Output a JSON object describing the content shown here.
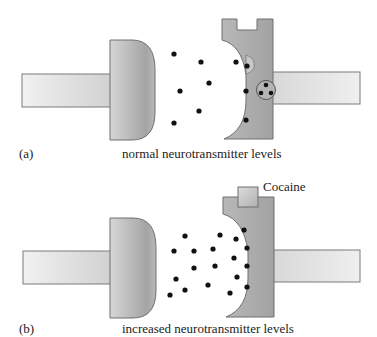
{
  "panels": [
    {
      "id": "a",
      "letter": "(a)",
      "caption": "normal neurotransmitter levels",
      "neurotransmitters": [
        [
          174,
          54
        ],
        [
          180,
          91
        ],
        [
          174,
          123
        ],
        [
          201,
          62
        ],
        [
          209,
          83
        ],
        [
          199,
          111
        ],
        [
          236,
          62
        ],
        [
          247,
          66
        ],
        [
          246,
          91
        ],
        [
          246,
          120
        ]
      ],
      "vesicle_dots": [
        [
          266,
          85
        ],
        [
          261,
          93
        ],
        [
          271,
          93
        ]
      ]
    },
    {
      "id": "b",
      "letter": "(b)",
      "caption": "increased neurotransmitter levels",
      "blocker_label": "Cocaine",
      "neurotransmitters": [
        [
          185,
          236
        ],
        [
          174,
          251
        ],
        [
          194,
          251
        ],
        [
          213,
          249
        ],
        [
          220,
          235
        ],
        [
          236,
          239
        ],
        [
          244,
          230
        ],
        [
          247,
          248
        ],
        [
          234,
          258
        ],
        [
          194,
          268
        ],
        [
          215,
          266
        ],
        [
          247,
          266
        ],
        [
          176,
          279
        ],
        [
          237,
          277
        ],
        [
          185,
          290
        ],
        [
          170,
          295
        ],
        [
          208,
          285
        ],
        [
          230,
          293
        ],
        [
          247,
          287
        ]
      ]
    }
  ],
  "colors": {
    "cell_fill_light": "#eeeeee",
    "cell_fill_dark": "#a8a8a8",
    "cell_stroke": "#6f6f6f",
    "dot": "#111111",
    "text": "#222222"
  }
}
